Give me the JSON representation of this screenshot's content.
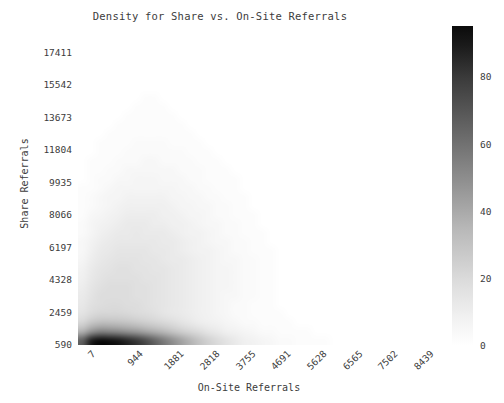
{
  "chart_data": {
    "type": "heatmap",
    "title": "Density for Share vs. On-Site Referrals",
    "xlabel": "On-Site Referrals",
    "ylabel": "Share Referrals",
    "xtick_labels": [
      "7",
      "944",
      "1881",
      "2818",
      "3755",
      "4691",
      "5628",
      "6565",
      "7502",
      "8439"
    ],
    "ytick_labels": [
      "590",
      "2459",
      "4328",
      "6197",
      "8066",
      "9935",
      "11804",
      "13673",
      "15542",
      "17411"
    ],
    "xtick_values": [
      7,
      944,
      1881,
      2818,
      3755,
      4691,
      5628,
      6565,
      7502,
      8439
    ],
    "ytick_values": [
      590,
      2459,
      4328,
      6197,
      8066,
      9935,
      11804,
      13673,
      15542,
      17411
    ],
    "xlim": [
      7,
      8905
    ],
    "ylim": [
      590,
      18346
    ],
    "grid": false,
    "colormap": "Greys",
    "colorbar": {
      "label": "",
      "position": "right",
      "vmin": 0,
      "vmax": 95,
      "tick_values": [
        0,
        20,
        40,
        60,
        80
      ],
      "tick_labels": [
        "0",
        "20",
        "40",
        "60",
        "80"
      ]
    },
    "bins": {
      "nx": 38,
      "ny": 34
    },
    "x_bin_centers": [
      124,
      358,
      593,
      827,
      1061,
      1296,
      1530,
      1764,
      1999,
      2233,
      2467,
      2702,
      2936,
      3170,
      3405,
      3639,
      3873,
      4108,
      4342,
      4576,
      4811,
      5045,
      5279,
      5514,
      5748,
      5982,
      6217,
      6451,
      6685,
      6920,
      7154,
      7388,
      7623,
      7857,
      8091,
      8326,
      8560,
      8794
    ],
    "y_bin_centers": [
      851,
      1373,
      1895,
      2417,
      2939,
      3461,
      3983,
      4505,
      5027,
      5549,
      6071,
      6593,
      7115,
      7637,
      8159,
      8681,
      9203,
      9725,
      10247,
      10769,
      11291,
      11813,
      12335,
      12857,
      13379,
      13901,
      14423,
      14945,
      15467,
      15989,
      16511,
      17033,
      17555,
      18077
    ],
    "density_rows_bottom_to_top": [
      [
        62,
        88,
        95,
        93,
        90,
        84,
        78,
        70,
        61,
        52,
        44,
        36,
        29,
        23,
        18,
        14,
        11,
        8,
        6,
        5,
        4,
        3,
        2,
        2,
        1,
        1,
        1,
        1,
        0,
        0,
        0,
        0,
        0,
        0,
        0,
        0,
        0,
        0
      ],
      [
        30,
        42,
        48,
        47,
        45,
        42,
        39,
        35,
        31,
        27,
        23,
        19,
        16,
        13,
        10,
        8,
        6,
        5,
        4,
        3,
        2,
        2,
        1,
        1,
        1,
        1,
        0,
        0,
        0,
        0,
        0,
        0,
        0,
        0,
        0,
        0,
        0,
        0
      ],
      [
        16,
        22,
        25,
        25,
        24,
        23,
        21,
        19,
        17,
        15,
        13,
        11,
        9,
        7,
        6,
        5,
        4,
        3,
        2,
        2,
        1,
        1,
        1,
        1,
        0,
        0,
        0,
        0,
        0,
        0,
        0,
        0,
        0,
        0,
        0,
        0,
        0,
        0
      ],
      [
        11,
        14,
        16,
        16,
        16,
        15,
        14,
        13,
        12,
        10,
        9,
        8,
        7,
        6,
        5,
        4,
        3,
        2,
        2,
        1,
        1,
        1,
        1,
        0,
        0,
        0,
        0,
        0,
        0,
        0,
        0,
        0,
        0,
        0,
        0,
        0,
        0,
        0
      ],
      [
        9,
        12,
        13,
        14,
        14,
        13,
        13,
        12,
        11,
        10,
        9,
        8,
        7,
        6,
        5,
        4,
        3,
        2,
        2,
        1,
        1,
        1,
        0,
        0,
        0,
        0,
        0,
        0,
        0,
        0,
        0,
        0,
        0,
        0,
        0,
        0,
        0,
        0
      ],
      [
        8,
        11,
        13,
        13,
        13,
        13,
        12,
        12,
        11,
        10,
        9,
        8,
        7,
        6,
        5,
        4,
        3,
        3,
        2,
        2,
        1,
        1,
        0,
        0,
        0,
        0,
        0,
        0,
        0,
        0,
        0,
        0,
        0,
        0,
        0,
        0,
        0,
        0
      ],
      [
        7,
        10,
        12,
        13,
        13,
        13,
        12,
        12,
        11,
        10,
        9,
        8,
        7,
        6,
        5,
        4,
        4,
        3,
        2,
        2,
        1,
        1,
        0,
        0,
        0,
        0,
        0,
        0,
        0,
        0,
        0,
        0,
        0,
        0,
        0,
        0,
        0,
        0
      ],
      [
        6,
        9,
        11,
        12,
        12,
        12,
        12,
        11,
        11,
        10,
        9,
        8,
        7,
        6,
        5,
        4,
        4,
        3,
        2,
        2,
        1,
        1,
        0,
        0,
        0,
        0,
        0,
        0,
        0,
        0,
        0,
        0,
        0,
        0,
        0,
        0,
        0,
        0
      ],
      [
        5,
        8,
        10,
        11,
        12,
        12,
        11,
        11,
        10,
        10,
        9,
        8,
        7,
        6,
        5,
        4,
        4,
        3,
        2,
        2,
        1,
        1,
        0,
        0,
        0,
        0,
        0,
        0,
        0,
        0,
        0,
        0,
        0,
        0,
        0,
        0,
        0,
        0
      ],
      [
        4,
        7,
        9,
        10,
        11,
        11,
        11,
        10,
        10,
        9,
        8,
        8,
        7,
        6,
        5,
        4,
        3,
        3,
        2,
        2,
        1,
        1,
        0,
        0,
        0,
        0,
        0,
        0,
        0,
        0,
        0,
        0,
        0,
        0,
        0,
        0,
        0,
        0
      ],
      [
        3,
        6,
        8,
        9,
        10,
        10,
        10,
        10,
        9,
        9,
        8,
        7,
        6,
        5,
        5,
        4,
        3,
        2,
        2,
        1,
        1,
        1,
        0,
        0,
        0,
        0,
        0,
        0,
        0,
        0,
        0,
        0,
        0,
        0,
        0,
        0,
        0,
        0
      ],
      [
        3,
        5,
        7,
        8,
        9,
        9,
        9,
        9,
        9,
        8,
        8,
        7,
        6,
        5,
        4,
        3,
        3,
        2,
        2,
        1,
        1,
        0,
        0,
        0,
        0,
        0,
        0,
        0,
        0,
        0,
        0,
        0,
        0,
        0,
        0,
        0,
        0,
        0
      ],
      [
        2,
        4,
        6,
        7,
        8,
        8,
        9,
        8,
        8,
        8,
        7,
        6,
        5,
        5,
        4,
        3,
        2,
        2,
        1,
        1,
        1,
        0,
        0,
        0,
        0,
        0,
        0,
        0,
        0,
        0,
        0,
        0,
        0,
        0,
        0,
        0,
        0,
        0
      ],
      [
        2,
        4,
        5,
        6,
        7,
        8,
        8,
        8,
        7,
        7,
        6,
        6,
        5,
        4,
        3,
        3,
        2,
        2,
        1,
        1,
        0,
        0,
        0,
        0,
        0,
        0,
        0,
        0,
        0,
        0,
        0,
        0,
        0,
        0,
        0,
        0,
        0,
        0
      ],
      [
        1,
        3,
        4,
        5,
        6,
        7,
        7,
        7,
        7,
        6,
        6,
        5,
        4,
        4,
        3,
        2,
        2,
        1,
        1,
        1,
        0,
        0,
        0,
        0,
        0,
        0,
        0,
        0,
        0,
        0,
        0,
        0,
        0,
        0,
        0,
        0,
        0,
        0
      ],
      [
        1,
        2,
        3,
        4,
        5,
        6,
        6,
        6,
        6,
        6,
        5,
        4,
        4,
        3,
        3,
        2,
        2,
        1,
        1,
        0,
        0,
        0,
        0,
        0,
        0,
        0,
        0,
        0,
        0,
        0,
        0,
        0,
        0,
        0,
        0,
        0,
        0,
        0
      ],
      [
        1,
        2,
        3,
        4,
        4,
        5,
        5,
        5,
        5,
        5,
        4,
        4,
        3,
        3,
        2,
        2,
        1,
        1,
        1,
        0,
        0,
        0,
        0,
        0,
        0,
        0,
        0,
        0,
        0,
        0,
        0,
        0,
        0,
        0,
        0,
        0,
        0,
        0
      ],
      [
        1,
        1,
        2,
        3,
        4,
        4,
        4,
        4,
        4,
        4,
        4,
        3,
        3,
        2,
        2,
        1,
        1,
        1,
        0,
        0,
        0,
        0,
        0,
        0,
        0,
        0,
        0,
        0,
        0,
        0,
        0,
        0,
        0,
        0,
        0,
        0,
        0,
        0
      ],
      [
        0,
        1,
        2,
        2,
        3,
        3,
        4,
        4,
        4,
        3,
        3,
        3,
        2,
        2,
        1,
        1,
        1,
        1,
        0,
        0,
        0,
        0,
        0,
        0,
        0,
        0,
        0,
        0,
        0,
        0,
        0,
        0,
        0,
        0,
        0,
        0,
        0,
        0
      ],
      [
        0,
        1,
        1,
        2,
        2,
        3,
        3,
        3,
        3,
        3,
        3,
        2,
        2,
        2,
        1,
        1,
        1,
        0,
        0,
        0,
        0,
        0,
        0,
        0,
        0,
        0,
        0,
        0,
        0,
        0,
        0,
        0,
        0,
        0,
        0,
        0,
        0,
        0
      ],
      [
        0,
        1,
        1,
        1,
        2,
        2,
        2,
        3,
        3,
        2,
        2,
        2,
        2,
        1,
        1,
        1,
        0,
        0,
        0,
        0,
        0,
        0,
        0,
        0,
        0,
        0,
        0,
        0,
        0,
        0,
        0,
        0,
        0,
        0,
        0,
        0,
        0,
        0
      ],
      [
        0,
        0,
        1,
        1,
        1,
        2,
        2,
        2,
        2,
        2,
        2,
        2,
        1,
        1,
        1,
        0,
        0,
        0,
        0,
        0,
        0,
        0,
        0,
        0,
        0,
        0,
        0,
        0,
        0,
        0,
        0,
        0,
        0,
        0,
        0,
        0,
        0,
        0
      ],
      [
        0,
        0,
        1,
        1,
        1,
        1,
        2,
        2,
        2,
        2,
        1,
        1,
        1,
        1,
        0,
        0,
        0,
        0,
        0,
        0,
        0,
        0,
        0,
        0,
        0,
        0,
        0,
        0,
        0,
        0,
        0,
        0,
        0,
        0,
        0,
        0,
        0,
        0
      ],
      [
        0,
        0,
        0,
        1,
        1,
        1,
        1,
        1,
        1,
        1,
        1,
        1,
        1,
        0,
        0,
        0,
        0,
        0,
        0,
        0,
        0,
        0,
        0,
        0,
        0,
        0,
        0,
        0,
        0,
        0,
        0,
        0,
        0,
        0,
        0,
        0,
        0,
        0
      ],
      [
        0,
        0,
        0,
        0,
        1,
        1,
        1,
        1,
        1,
        1,
        1,
        1,
        0,
        0,
        0,
        0,
        0,
        0,
        0,
        0,
        0,
        0,
        0,
        0,
        0,
        0,
        0,
        0,
        0,
        0,
        0,
        0,
        0,
        0,
        0,
        0,
        0,
        0
      ],
      [
        0,
        0,
        0,
        0,
        0,
        1,
        1,
        1,
        1,
        1,
        1,
        0,
        0,
        0,
        0,
        0,
        0,
        0,
        0,
        0,
        0,
        0,
        0,
        0,
        0,
        0,
        0,
        0,
        0,
        0,
        0,
        0,
        0,
        0,
        0,
        0,
        0,
        0
      ],
      [
        0,
        0,
        0,
        0,
        0,
        0,
        1,
        1,
        1,
        1,
        0,
        0,
        0,
        0,
        0,
        0,
        0,
        0,
        0,
        0,
        0,
        0,
        0,
        0,
        0,
        0,
        0,
        0,
        0,
        0,
        0,
        0,
        0,
        0,
        0,
        0,
        0,
        0
      ],
      [
        0,
        0,
        0,
        0,
        0,
        0,
        0,
        1,
        1,
        0,
        0,
        0,
        0,
        0,
        0,
        0,
        0,
        0,
        0,
        0,
        0,
        0,
        0,
        0,
        0,
        0,
        0,
        0,
        0,
        0,
        0,
        0,
        0,
        0,
        0,
        0,
        0,
        0
      ],
      [
        0,
        0,
        0,
        0,
        0,
        0,
        0,
        0,
        0,
        0,
        0,
        0,
        0,
        0,
        0,
        0,
        0,
        0,
        0,
        0,
        0,
        0,
        0,
        0,
        0,
        0,
        0,
        0,
        0,
        0,
        0,
        0,
        0,
        0,
        0,
        0,
        0,
        0
      ],
      [
        0,
        0,
        0,
        0,
        0,
        0,
        0,
        0,
        0,
        0,
        0,
        0,
        0,
        0,
        0,
        0,
        0,
        0,
        0,
        0,
        0,
        0,
        0,
        0,
        0,
        0,
        0,
        0,
        0,
        0,
        0,
        0,
        0,
        0,
        0,
        0,
        0,
        0
      ],
      [
        0,
        0,
        0,
        0,
        0,
        0,
        0,
        0,
        0,
        0,
        0,
        0,
        0,
        0,
        0,
        0,
        0,
        0,
        0,
        0,
        0,
        0,
        0,
        0,
        0,
        0,
        0,
        0,
        0,
        0,
        0,
        0,
        0,
        0,
        0,
        0,
        0,
        0
      ],
      [
        0,
        0,
        0,
        0,
        0,
        0,
        0,
        0,
        0,
        0,
        0,
        0,
        0,
        0,
        0,
        0,
        0,
        0,
        0,
        0,
        0,
        0,
        0,
        0,
        0,
        0,
        0,
        0,
        0,
        0,
        0,
        0,
        0,
        0,
        0,
        0,
        0,
        0
      ],
      [
        0,
        0,
        0,
        0,
        0,
        0,
        0,
        0,
        0,
        0,
        0,
        0,
        0,
        0,
        0,
        0,
        0,
        0,
        0,
        0,
        0,
        0,
        0,
        0,
        0,
        0,
        0,
        0,
        0,
        0,
        0,
        0,
        0,
        0,
        0,
        0,
        0,
        0
      ],
      [
        0,
        0,
        0,
        0,
        0,
        0,
        0,
        0,
        0,
        0,
        0,
        0,
        0,
        0,
        0,
        0,
        0,
        0,
        0,
        0,
        0,
        0,
        0,
        0,
        0,
        0,
        0,
        0,
        0,
        0,
        0,
        0,
        0,
        0,
        0,
        0,
        0,
        0
      ]
    ]
  }
}
